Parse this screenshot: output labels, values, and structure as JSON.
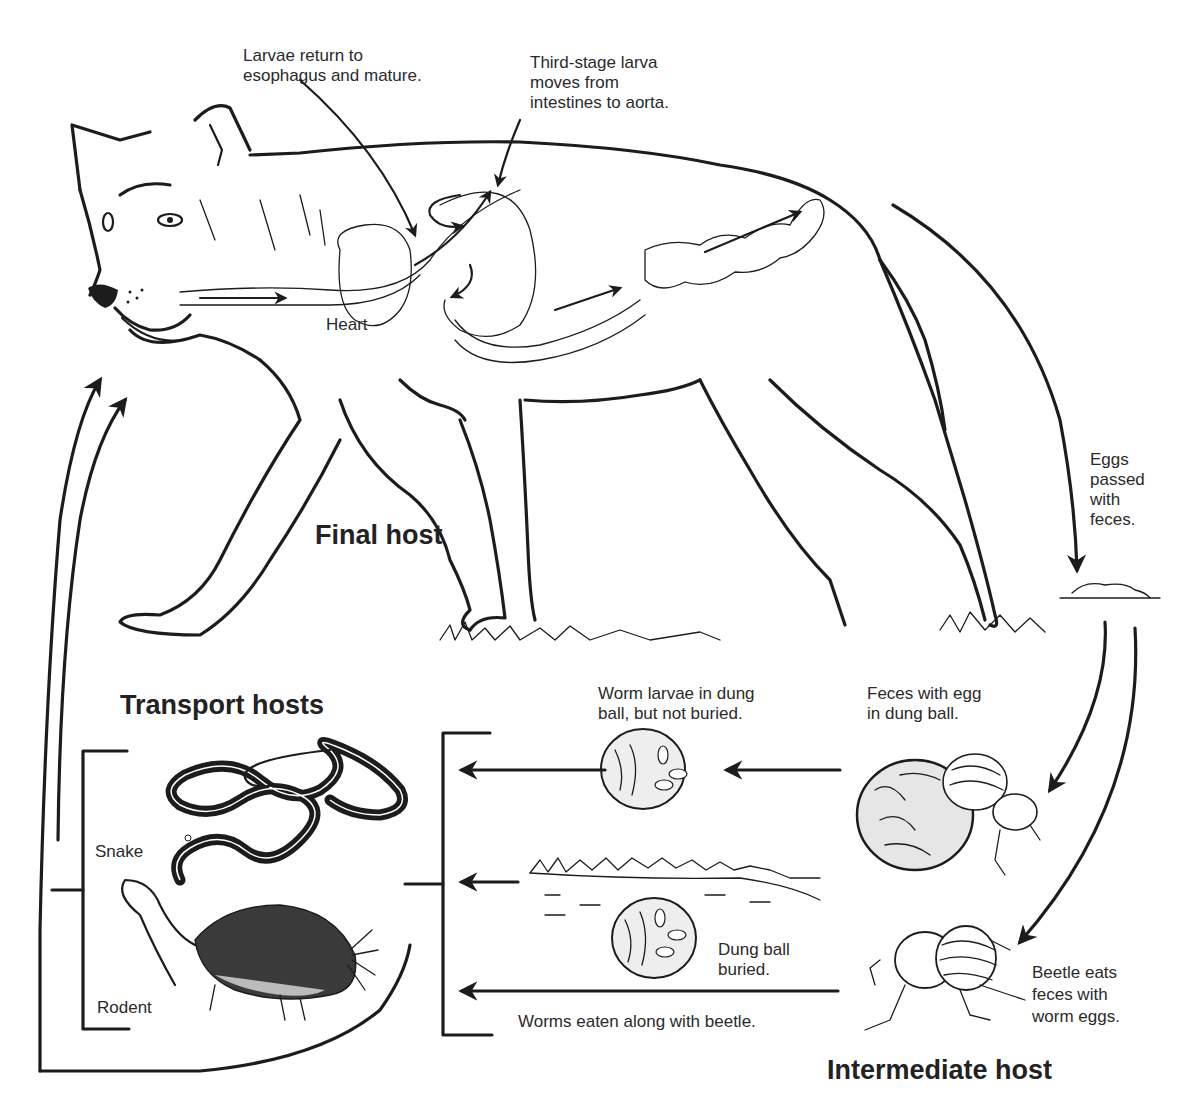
{
  "diagram": {
    "hosts": {
      "final": "Final host",
      "transport": "Transport hosts",
      "intermediate": "Intermediate host"
    },
    "annotations": {
      "larvae_return": "Larvae return to\nesophagus and mature.",
      "third_stage": "Third-stage larva\nmoves from\nintestines to aorta.",
      "heart": "Heart",
      "eggs_passed": "Eggs\npassed\nwith\nfeces.",
      "worm_larvae_not_buried": "Worm larvae in dung\nball, but not buried.",
      "feces_with_egg": "Feces with egg\nin dung ball.",
      "dung_ball_buried": "Dung ball\nburied.",
      "worms_eaten": "Worms eaten along with beetle.",
      "beetle_eats": "Beetle eats\nfeces with\nworm eggs.",
      "snake": "Snake",
      "rodent": "Rodent"
    },
    "colors": {
      "ink": "#1c1c1c",
      "background": "#ffffff",
      "dung_fill": "#e6e6e6",
      "rodent_fill": "#3a3a3a"
    }
  }
}
